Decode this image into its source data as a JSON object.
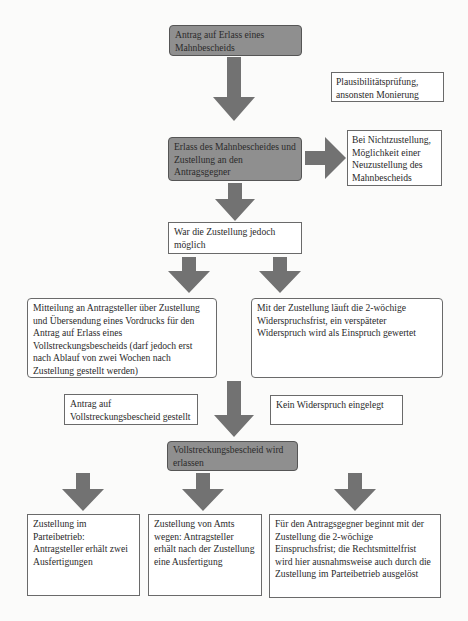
{
  "colors": {
    "gray_box_fill": "#8f8f8f",
    "arrow_fill": "#727272",
    "border": "#6a6a6a",
    "background": "#fbfbfa"
  },
  "nodes": {
    "antrag_mahnbescheid": "Antrag auf Erlass eines Mahnbescheids",
    "plausibilitaet": "Plausibilitätsprüfung, ansonsten Monierung",
    "erlass_zustellung": "Erlass des Mahnbescheides und Zustellung an den Antragsgegner",
    "nichtzustellung": "Bei Nichtzustellung, Möglichkeit einer Neuzustellung des Mahnbescheids",
    "zustellung_moeglich": "War die Zustellung jedoch möglich",
    "mitteilung": "Mitteilung an Antragsteller über Zustellung und Übersendung eines Vordrucks für den Antrag auf Erlass eines Vollstreckungsbescheids (darf jedoch erst nach Ablauf von zwei Wochen nach Zustellung gestellt werden)",
    "widerspruchsfrist": "Mit der Zustellung läuft die 2-wöchige Widerspruchsfrist, ein verspäteter Widerspruch wird als Einspruch gewertet",
    "antrag_vollstreckung": "Antrag auf Vollstreckungsbescheid gestellt",
    "kein_widerspruch": "Kein Widerspruch eingelegt",
    "vollstreckungsbescheid": "Vollstreckungsbescheid wird erlassen",
    "parteibetrieb": "Zustellung im Parteibetrieb: Antragsteller erhält zwei Ausfertigungen",
    "amts_wegen": "Zustellung von Amts wegen: Antragsteller erhält nach der Zustellung eine Ausfertigung",
    "einspruchsfrist": "Für den Antragsgegner beginnt mit der Zustellung die 2-wöchige Einspruchsfrist; die Rechtsmittelfrist wird hier ausnahmsweise auch durch die Zustellung im Parteibetrieb ausgelöst"
  },
  "edges": [
    {
      "from": "antrag_mahnbescheid",
      "to": "erlass_zustellung"
    },
    {
      "from": "erlass_zustellung",
      "to": "nichtzustellung"
    },
    {
      "from": "erlass_zustellung",
      "to": "zustellung_moeglich"
    },
    {
      "from": "zustellung_moeglich",
      "to": "mitteilung"
    },
    {
      "from": "zustellung_moeglich",
      "to": "widerspruchsfrist"
    },
    {
      "from": "mitteilung",
      "to": "vollstreckungsbescheid"
    },
    {
      "from": "widerspruchsfrist",
      "to": "vollstreckungsbescheid"
    },
    {
      "from": "vollstreckungsbescheid",
      "to": "parteibetrieb"
    },
    {
      "from": "vollstreckungsbescheid",
      "to": "amts_wegen"
    },
    {
      "from": "vollstreckungsbescheid",
      "to": "einspruchsfrist"
    }
  ]
}
